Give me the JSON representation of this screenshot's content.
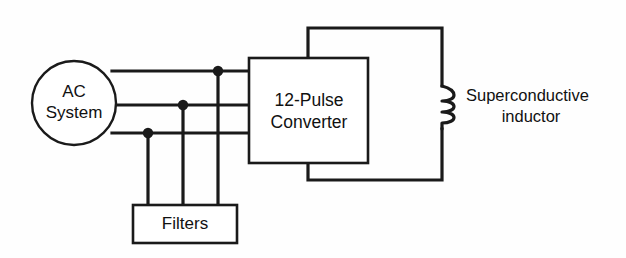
{
  "diagram": {
    "background_color": "#fefefe",
    "line_color": "#1a1a1a",
    "nodes": {
      "ac_system": {
        "label_line1": "AC",
        "label_line2": "System",
        "shape": "circle",
        "cx": 74,
        "cy": 103,
        "r": 42
      },
      "converter": {
        "label_line1": "12-Pulse",
        "label_line2": "Converter",
        "shape": "rect",
        "x": 249,
        "y": 58,
        "width": 119,
        "height": 105
      },
      "filters": {
        "label": "Filters",
        "shape": "rect",
        "x": 133,
        "y": 205,
        "width": 104,
        "height": 38
      },
      "inductor": {
        "label_line1": "Superconductive",
        "label_line2": "inductor",
        "shape": "coil",
        "x": 442,
        "y_top": 85,
        "y_bottom": 130,
        "turns": 3
      }
    },
    "connections": {
      "phase_lines": [
        {
          "name": "phase-a",
          "y": 71,
          "x_start": 112,
          "x_end": 249
        },
        {
          "name": "phase-b",
          "y": 105,
          "x_start": 116,
          "x_end": 249
        },
        {
          "name": "phase-c",
          "y": 133,
          "x_start": 112,
          "x_end": 249
        }
      ],
      "junction_dots": [
        {
          "name": "junction-phase-a",
          "cx": 218,
          "cy": 71,
          "r": 5.2
        },
        {
          "name": "junction-phase-b",
          "cx": 183,
          "cy": 105,
          "r": 5.2
        },
        {
          "name": "junction-phase-c",
          "cx": 148,
          "cy": 133,
          "r": 5.2
        }
      ],
      "filter_taps": [
        {
          "name": "filter-tap-left",
          "x": 148,
          "y_start": 133,
          "y_end": 205
        },
        {
          "name": "filter-tap-middle",
          "x": 183,
          "y_start": 105,
          "y_end": 205
        },
        {
          "name": "filter-tap-right",
          "x": 218,
          "y_start": 71,
          "y_end": 205
        }
      ],
      "dc_rail_positive": {
        "name": "dc-rail-positive",
        "path": "M 308 58 L 308 28 L 442 28 L 442 85"
      },
      "dc_rail_negative": {
        "name": "dc-rail-negative",
        "path": "M 308 163 L 308 180 L 442 180 L 442 130"
      }
    },
    "labels": {
      "inductor_text_x": 466,
      "inductor_line1_y": 97,
      "inductor_line2_y": 118
    }
  }
}
